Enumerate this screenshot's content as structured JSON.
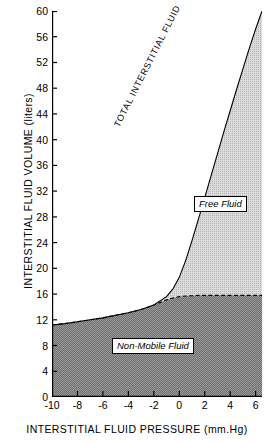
{
  "chart_data": {
    "type": "area",
    "title": "",
    "xlabel": "INTERSTITIAL FLUID PRESSURE (mm.Hg)",
    "ylabel": "INTERSTITIAL FLUID VOLUME (liters)",
    "xlim": [
      -10,
      6.5
    ],
    "ylim": [
      0,
      60
    ],
    "grid": false,
    "legend_position": "in-plot annotations",
    "xticks": [
      -10,
      -8,
      -6,
      -4,
      -2,
      0,
      2,
      4,
      6
    ],
    "xticklabels": [
      "-10",
      "-8",
      "-6",
      "-4",
      "-2",
      "0",
      "2",
      "4",
      "6"
    ],
    "yticks": [
      0,
      4,
      8,
      12,
      16,
      20,
      24,
      28,
      32,
      36,
      40,
      44,
      48,
      52,
      56,
      60
    ],
    "yticklabels": [
      "0",
      "4",
      "8",
      "12",
      "16",
      "20",
      "24",
      "28",
      "32",
      "36",
      "40",
      "44",
      "48",
      "52",
      "56",
      "60"
    ],
    "x": [
      -10,
      -9,
      -8,
      -7,
      -6,
      -5,
      -4,
      -3,
      -2,
      -1,
      -0.5,
      0,
      0.5,
      1,
      1.5,
      2,
      2.5,
      3,
      3.5,
      4,
      4.5,
      5,
      5.5,
      6,
      6.5
    ],
    "series": [
      {
        "name": "TOTAL INTERSTITIAL FLUID",
        "style": "solid-line-upper-boundary",
        "values": [
          11.2,
          11.4,
          11.7,
          12.0,
          12.3,
          12.7,
          13.1,
          13.6,
          14.3,
          15.6,
          16.8,
          18.6,
          21.2,
          24.3,
          27.6,
          31.0,
          34.4,
          37.8,
          41.2,
          44.5,
          47.8,
          51.0,
          54.2,
          57.2,
          60.0
        ]
      },
      {
        "name": "Non-Mobile Fluid",
        "style": "dashed-line-lower-boundary",
        "values": [
          11.2,
          11.4,
          11.7,
          12.0,
          12.3,
          12.7,
          13.1,
          13.6,
          14.3,
          15.1,
          15.4,
          15.6,
          15.7,
          15.75,
          15.8,
          15.8,
          15.8,
          15.8,
          15.8,
          15.8,
          15.8,
          15.8,
          15.8,
          15.8,
          15.8
        ]
      }
    ],
    "regions": [
      {
        "name": "Free Fluid",
        "between": [
          "Non-Mobile Fluid",
          "TOTAL INTERSTITIAL FLUID"
        ],
        "fill": "#c9c9c9"
      },
      {
        "name": "Non-Mobile Fluid",
        "between": [
          "baseline-0",
          "Non-Mobile Fluid"
        ],
        "fill": "#8c8c8c"
      }
    ],
    "annotations": [
      {
        "text": "TOTAL INTERSTITIAL FLUID",
        "type": "rotated-curve-label",
        "rotation": -63
      },
      {
        "text": "Free Fluid",
        "type": "boxed-label",
        "italic": true
      },
      {
        "text": "Non-Mobile Fluid",
        "type": "boxed-label",
        "italic": true
      }
    ],
    "colors": {
      "axis": "#000000",
      "free_fluid_fill": "#c9c9c9",
      "non_mobile_fill": "#8c8c8c",
      "background": "#ffffff"
    }
  },
  "labels": {
    "free_fluid": "Free Fluid",
    "non_mobile_fluid": "Non-Mobile Fluid",
    "total_interstitial_fluid": "TOTAL INTERSTITIAL FLUID"
  }
}
